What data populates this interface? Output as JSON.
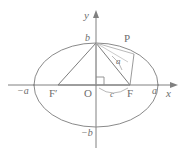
{
  "figure": {
    "kind": "ellipse-geometry-diagram",
    "width": 190,
    "height": 159,
    "background_color": "#ffffff",
    "stroke_color": "#808080",
    "light_stroke_color": "#a6a6a6",
    "label_color": "#6e6e6e"
  },
  "axes": {
    "x_axis_label": "x",
    "y_axis_label": "y",
    "origin_label": "O",
    "x_axis_y_px": 85,
    "y_axis_x_px": 96
  },
  "ellipse": {
    "center_x_px": 96,
    "center_y_px": 85,
    "semi_major_px": 62,
    "semi_minor_px": 42
  },
  "vertex_labels": {
    "right_major": "a",
    "left_major": "−a",
    "top_minor": "b",
    "bottom_minor": "−b"
  },
  "points": [
    {
      "name": "left-focus",
      "label": "F′",
      "x": 58,
      "y": 85
    },
    {
      "name": "right-focus",
      "label": "F",
      "x": 130,
      "y": 85
    },
    {
      "name": "point-p",
      "label": "P",
      "x": 134,
      "y": 54
    },
    {
      "name": "top-vertex",
      "label": "b",
      "x": 96,
      "y": 43
    }
  ],
  "measure_labels": {
    "focal_distance": "c",
    "semi_major_segment": "a"
  },
  "markers": {
    "right_angle_at_origin": true,
    "focal_arc": true,
    "angle_arc": true
  }
}
